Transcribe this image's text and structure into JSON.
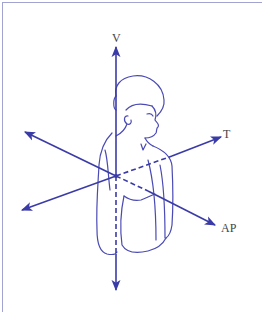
{
  "figure": {
    "colors": {
      "axis": "#3b3ba8",
      "outline": "#4a4ab5",
      "frame": "#a3a3d2",
      "label": "#444444",
      "background": "#ffffff"
    },
    "axes": [
      {
        "id": "vertical",
        "label": "V"
      },
      {
        "id": "transverse",
        "label": "T"
      },
      {
        "id": "anteroposterior",
        "label": "AP"
      }
    ]
  }
}
